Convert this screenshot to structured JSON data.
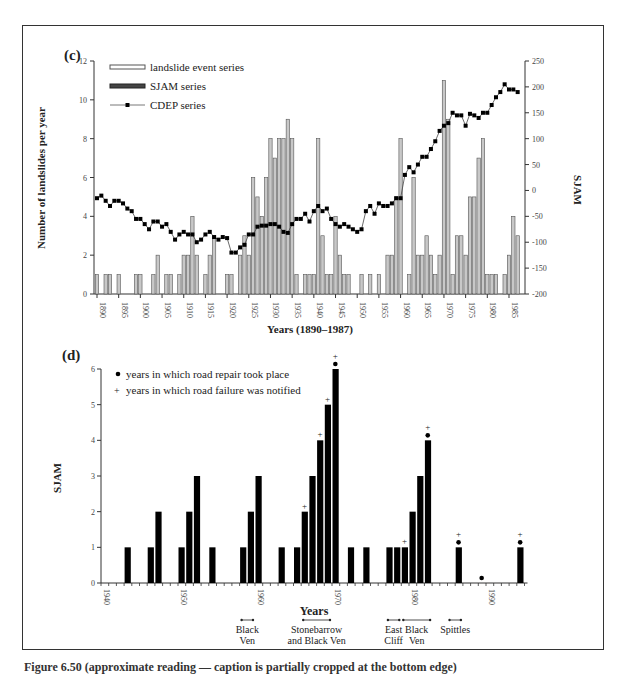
{
  "figure": {
    "caption": "Figure 6.50 (approximate reading — caption is partially cropped at the bottom edge)"
  },
  "colors": {
    "bar_fill": "#c8c8c8",
    "bar_stroke": "#555555",
    "sjam_bar": "#000000",
    "cdep_line": "#000000",
    "frame": "#333333"
  },
  "chart_data": [
    {
      "panel": "(c)",
      "type": "bar",
      "title": "",
      "xlabel": "Years (1890–1987)",
      "ylabel": "Number of landslides per year",
      "y2label": "SJAM",
      "ylim": [
        0,
        12
      ],
      "y2lim": [
        -200,
        250
      ],
      "yticks": [
        0,
        2,
        4,
        6,
        8,
        10,
        12
      ],
      "y2ticks": [
        -200,
        -150,
        -100,
        -50,
        0,
        50,
        100,
        150,
        200,
        250
      ],
      "xticks": [
        1890,
        1895,
        1900,
        1905,
        1910,
        1915,
        1920,
        1925,
        1930,
        1935,
        1940,
        1945,
        1950,
        1955,
        1960,
        1965,
        1970,
        1975,
        1980,
        1985
      ],
      "legend": [
        "landslide event series",
        "SJAM series",
        "CDEP series"
      ],
      "legend_position": "upper left",
      "grid": false,
      "x": [
        1890,
        1891,
        1892,
        1893,
        1894,
        1895,
        1896,
        1897,
        1898,
        1899,
        1900,
        1901,
        1902,
        1903,
        1904,
        1905,
        1906,
        1907,
        1908,
        1909,
        1910,
        1911,
        1912,
        1913,
        1914,
        1915,
        1916,
        1917,
        1918,
        1919,
        1920,
        1921,
        1922,
        1923,
        1924,
        1925,
        1926,
        1927,
        1928,
        1929,
        1930,
        1931,
        1932,
        1933,
        1934,
        1935,
        1936,
        1937,
        1938,
        1939,
        1940,
        1941,
        1942,
        1943,
        1944,
        1945,
        1946,
        1947,
        1948,
        1949,
        1950,
        1951,
        1952,
        1953,
        1954,
        1955,
        1956,
        1957,
        1958,
        1959,
        1960,
        1961,
        1962,
        1963,
        1964,
        1965,
        1966,
        1967,
        1968,
        1969,
        1970,
        1971,
        1972,
        1973,
        1974,
        1975,
        1976,
        1977,
        1978,
        1979,
        1980,
        1981,
        1982,
        1983,
        1984,
        1985,
        1986,
        1987
      ],
      "series": [
        {
          "name": "landslide event series",
          "values": [
            1,
            0,
            1,
            1,
            0,
            1,
            0,
            0,
            0,
            1,
            1,
            0,
            0,
            1,
            2,
            0,
            1,
            1,
            0,
            1,
            2,
            2,
            4,
            2,
            0,
            1,
            2,
            3,
            0,
            0,
            1,
            1,
            0,
            2,
            3,
            2,
            6,
            5,
            4,
            6,
            8,
            7,
            8,
            8,
            9,
            8,
            1,
            0,
            1,
            1,
            1,
            8,
            3,
            1,
            1,
            4,
            2,
            1,
            1,
            0,
            0,
            1,
            0,
            1,
            0,
            1,
            0,
            2,
            2,
            5,
            8,
            0,
            1,
            6,
            2,
            2,
            3,
            2,
            1,
            2,
            11,
            9,
            1,
            3,
            3,
            2,
            5,
            5,
            7,
            8,
            1,
            1,
            1,
            0,
            1,
            2,
            4,
            3
          ]
        },
        {
          "name": "CDEP series",
          "axis": "right",
          "values": [
            -15,
            -10,
            -20,
            -30,
            -20,
            -20,
            -25,
            -35,
            -40,
            -55,
            -55,
            -65,
            -75,
            -60,
            -60,
            -70,
            -65,
            -80,
            -95,
            -85,
            -80,
            -85,
            -85,
            -100,
            -95,
            -85,
            -80,
            -90,
            -95,
            -90,
            -92,
            -120,
            -120,
            -110,
            -105,
            -85,
            -85,
            -70,
            -68,
            -68,
            -65,
            -65,
            -70,
            -80,
            -82,
            -65,
            -55,
            -55,
            -45,
            -60,
            -40,
            -30,
            -40,
            -35,
            -55,
            -65,
            -70,
            -65,
            -70,
            -75,
            -80,
            -75,
            -40,
            -30,
            -45,
            -25,
            -30,
            -30,
            -25,
            -15,
            -15,
            30,
            45,
            35,
            50,
            65,
            65,
            80,
            95,
            115,
            125,
            130,
            150,
            145,
            145,
            125,
            148,
            145,
            140,
            150,
            150,
            165,
            180,
            190,
            205,
            195,
            195,
            190,
            215,
            225
          ]
        }
      ]
    },
    {
      "panel": "(d)",
      "type": "bar",
      "title": "",
      "xlabel": "Years",
      "ylabel": "SJAM",
      "ylim": [
        0,
        6
      ],
      "yticks": [
        0,
        1,
        2,
        3,
        4,
        5,
        6
      ],
      "xticks": [
        1940,
        1950,
        1960,
        1970,
        1980,
        1990
      ],
      "legend": [
        "years in which road repair took place",
        "years in which road failure was notified"
      ],
      "legend_markers": [
        "●",
        "+"
      ],
      "legend_position": "upper left",
      "grid": false,
      "categories": [
        1943,
        1946,
        1947,
        1950,
        1951,
        1952,
        1954,
        1958,
        1959,
        1960,
        1963,
        1965,
        1966,
        1967,
        1968,
        1969,
        1970,
        1972,
        1974,
        1977,
        1978,
        1979,
        1980,
        1981,
        1982,
        1986,
        1994
      ],
      "values": [
        1,
        1,
        2,
        1,
        2,
        3,
        1,
        1,
        2,
        3,
        1,
        1,
        2,
        3,
        4,
        5,
        6,
        1,
        1,
        1,
        1,
        1,
        2,
        3,
        4,
        1,
        1
      ],
      "road_repair_years": [
        1970,
        1982,
        1986,
        1989,
        1994
      ],
      "road_failure_years": [
        1966,
        1968,
        1969,
        1970,
        1979,
        1982,
        1986,
        1994
      ],
      "annotations": [
        {
          "label": "Black Ven",
          "years": [
            1958,
            1959
          ]
        },
        {
          "label": "Stonebarrow and Black Ven",
          "years": [
            1966,
            1969
          ]
        },
        {
          "label": "East Cliff",
          "years": [
            1977,
            1978
          ]
        },
        {
          "label": "Black Ven",
          "years": [
            1979,
            1982
          ]
        },
        {
          "label": "Spittles",
          "years": [
            1985,
            1986
          ]
        }
      ]
    }
  ]
}
